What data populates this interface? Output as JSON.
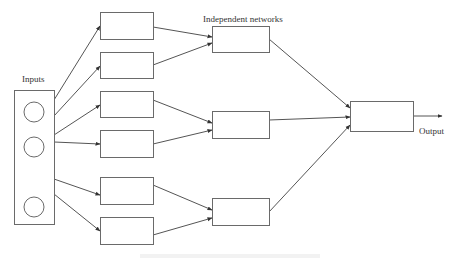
{
  "diagram": {
    "labels": {
      "inputs": "Inputs",
      "independent_networks": "Independent networks",
      "output": "Output"
    },
    "colors": {
      "stroke": "#6a6a6a",
      "edge": "#555555",
      "text": "#333333",
      "background": "#ffffff"
    },
    "input_block": {
      "box": {
        "x": 14,
        "y": 90,
        "w": 40,
        "h": 134
      },
      "circles": [
        {
          "cx": 34,
          "cy": 112,
          "r": 10
        },
        {
          "cx": 34,
          "cy": 147,
          "r": 10
        },
        {
          "cx": 34,
          "cy": 207,
          "r": 10
        }
      ]
    },
    "first_layer_boxes": [
      {
        "x": 100,
        "y": 12,
        "w": 53,
        "h": 27
      },
      {
        "x": 100,
        "y": 52,
        "w": 53,
        "h": 26
      },
      {
        "x": 100,
        "y": 91,
        "w": 53,
        "h": 26
      },
      {
        "x": 100,
        "y": 130,
        "w": 53,
        "h": 27
      },
      {
        "x": 100,
        "y": 177,
        "w": 53,
        "h": 27
      },
      {
        "x": 100,
        "y": 217,
        "w": 53,
        "h": 27
      }
    ],
    "independent_network_boxes": [
      {
        "x": 212,
        "y": 26,
        "w": 57,
        "h": 26
      },
      {
        "x": 212,
        "y": 111,
        "w": 57,
        "h": 27
      },
      {
        "x": 212,
        "y": 198,
        "w": 57,
        "h": 27
      }
    ],
    "output_box": {
      "x": 350,
      "y": 101,
      "w": 63,
      "h": 30
    },
    "edges": [
      {
        "from": [
          54,
          100
        ],
        "to": [
          100,
          26
        ]
      },
      {
        "from": [
          54,
          116
        ],
        "to": [
          100,
          66
        ]
      },
      {
        "from": [
          54,
          135
        ],
        "to": [
          100,
          105
        ]
      },
      {
        "from": [
          54,
          142
        ],
        "to": [
          100,
          144
        ]
      },
      {
        "from": [
          54,
          179
        ],
        "to": [
          100,
          195
        ]
      },
      {
        "from": [
          54,
          194
        ],
        "to": [
          100,
          231
        ]
      },
      {
        "from": [
          153,
          27
        ],
        "to": [
          212,
          37
        ]
      },
      {
        "from": [
          153,
          65
        ],
        "to": [
          212,
          43
        ]
      },
      {
        "from": [
          153,
          100
        ],
        "to": [
          212,
          123
        ]
      },
      {
        "from": [
          153,
          144
        ],
        "to": [
          212,
          130
        ]
      },
      {
        "from": [
          153,
          185
        ],
        "to": [
          212,
          210
        ]
      },
      {
        "from": [
          153,
          235
        ],
        "to": [
          212,
          218
        ]
      },
      {
        "from": [
          269,
          39
        ],
        "to": [
          350,
          108
        ]
      },
      {
        "from": [
          269,
          120
        ],
        "to": [
          350,
          117
        ]
      },
      {
        "from": [
          269,
          212
        ],
        "to": [
          350,
          125
        ]
      },
      {
        "from": [
          413,
          116
        ],
        "to": [
          442,
          116
        ]
      }
    ]
  }
}
